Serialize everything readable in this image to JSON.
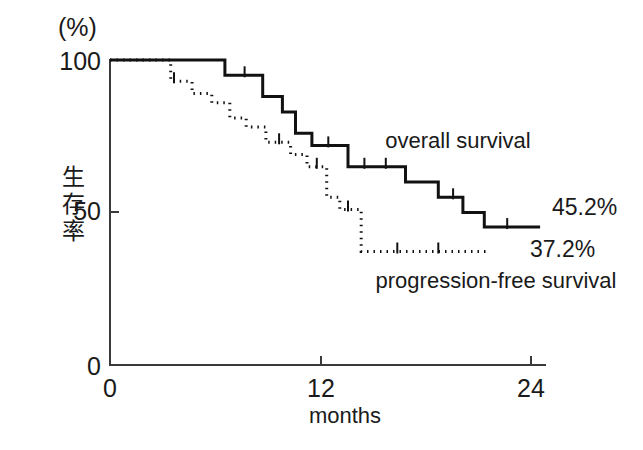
{
  "chart_data": {
    "type": "line",
    "title": "",
    "xlabel": "months",
    "ylabel": "生存率",
    "yunit": "(%)",
    "xlim": [
      0,
      26.5
    ],
    "ylim": [
      0,
      100
    ],
    "xticks": [
      0,
      12,
      24
    ],
    "xticklabels": [
      "0",
      "12",
      "24"
    ],
    "yticks": [
      0,
      50,
      100
    ],
    "yticklabels": [
      "0",
      "50",
      "100"
    ],
    "grid": false,
    "legend_position": "inline-annotation",
    "series": [
      {
        "name": "overall survival",
        "style": "solid",
        "final_value": 45.2,
        "final_label": "45.2%",
        "steps": [
          [
            0.0,
            100
          ],
          [
            7.0,
            100
          ],
          [
            7.0,
            95
          ],
          [
            9.3,
            95
          ],
          [
            9.3,
            88
          ],
          [
            10.5,
            88
          ],
          [
            10.5,
            83
          ],
          [
            11.3,
            83
          ],
          [
            11.3,
            76
          ],
          [
            12.3,
            76
          ],
          [
            12.3,
            72
          ],
          [
            14.5,
            72
          ],
          [
            14.5,
            65
          ],
          [
            18.0,
            65
          ],
          [
            18.0,
            60
          ],
          [
            20.0,
            60
          ],
          [
            20.0,
            55
          ],
          [
            21.5,
            55
          ],
          [
            21.5,
            50
          ],
          [
            22.8,
            50
          ],
          [
            22.8,
            45.2
          ],
          [
            26.2,
            45.2
          ]
        ],
        "censor_times": [
          8.2,
          13.3,
          15.5,
          16.8,
          20.9,
          24.2
        ]
      },
      {
        "name": "progression-free survival",
        "style": "dotted",
        "final_value": 37.2,
        "final_label": "37.2%",
        "steps": [
          [
            0.0,
            100
          ],
          [
            3.7,
            100
          ],
          [
            3.7,
            93
          ],
          [
            5.0,
            93
          ],
          [
            5.0,
            89
          ],
          [
            6.2,
            89
          ],
          [
            6.2,
            86
          ],
          [
            7.3,
            86
          ],
          [
            7.3,
            81
          ],
          [
            8.3,
            81
          ],
          [
            8.3,
            78
          ],
          [
            9.5,
            78
          ],
          [
            9.5,
            73
          ],
          [
            11.0,
            73
          ],
          [
            11.0,
            69
          ],
          [
            12.0,
            69
          ],
          [
            12.0,
            65
          ],
          [
            13.2,
            65
          ],
          [
            13.2,
            55
          ],
          [
            14.0,
            55
          ],
          [
            14.0,
            51
          ],
          [
            15.3,
            51
          ],
          [
            15.3,
            37.2
          ],
          [
            23.0,
            37.2
          ]
        ],
        "censor_times": [
          3.9,
          10.3,
          12.6,
          14.5,
          17.5,
          20.0
        ]
      }
    ]
  },
  "annotations": {
    "overall_survival_label": "overall survival",
    "pfs_label": "progression-free survival",
    "os_endpoint": "45.2%",
    "pfs_endpoint": "37.2%"
  }
}
